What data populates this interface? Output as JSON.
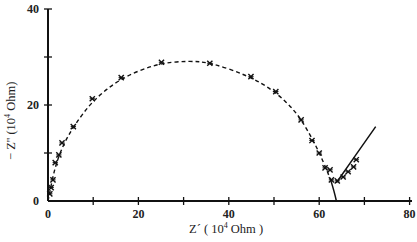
{
  "chart_data": {
    "type": "scatter",
    "title": "",
    "xlabel": "Z´ (10⁴ Ohm)",
    "ylabel": "− Z'' (10⁴ Ohm)",
    "xlim": [
      0,
      80
    ],
    "ylim": [
      0,
      40
    ],
    "x_ticks": [
      0,
      20,
      40,
      60,
      80
    ],
    "x_minor_ticks": [
      10,
      30,
      50,
      70
    ],
    "y_ticks": [
      0,
      20,
      40
    ],
    "y_minor_ticks": [
      10,
      30
    ],
    "grid": false,
    "legend": null,
    "series": [
      {
        "name": "measured",
        "marker": "x",
        "points": [
          [
            0.4,
            1.5
          ],
          [
            0.7,
            2.8
          ],
          [
            1.1,
            4.4
          ],
          [
            1.6,
            8.0
          ],
          [
            2.4,
            9.6
          ],
          [
            3.1,
            12.1
          ],
          [
            5.6,
            15.5
          ],
          [
            9.8,
            21.3
          ],
          [
            16.2,
            25.7
          ],
          [
            25.1,
            28.9
          ],
          [
            35.8,
            28.7
          ],
          [
            44.9,
            25.9
          ],
          [
            50.4,
            22.8
          ],
          [
            56.0,
            16.9
          ],
          [
            58.4,
            12.6
          ],
          [
            60.0,
            10.0
          ],
          [
            61.3,
            6.9
          ],
          [
            62.4,
            6.5
          ],
          [
            62.7,
            4.4
          ],
          [
            64.0,
            4.2
          ],
          [
            65.3,
            5.0
          ],
          [
            66.4,
            6.1
          ],
          [
            67.6,
            7.1
          ],
          [
            68.2,
            8.6
          ]
        ]
      },
      {
        "name": "fitted semicircle",
        "style": "dashed",
        "points": [
          [
            0,
            0
          ],
          [
            1.5,
            7
          ],
          [
            3.5,
            12
          ],
          [
            6,
            16
          ],
          [
            10,
            21
          ],
          [
            16,
            25.5
          ],
          [
            24,
            28.6
          ],
          [
            31,
            29.2
          ],
          [
            36,
            28.8
          ],
          [
            44,
            26.2
          ],
          [
            50,
            23
          ],
          [
            55,
            18.5
          ],
          [
            58.5,
            13
          ],
          [
            61,
            8
          ],
          [
            62.5,
            4.5
          ]
        ]
      },
      {
        "name": "fitted arc to axis",
        "style": "solid",
        "points": [
          [
            62.5,
            4.5
          ],
          [
            63.3,
            2
          ],
          [
            63.8,
            0
          ]
        ]
      },
      {
        "name": "diffusion line",
        "style": "solid",
        "points": [
          [
            63.8,
            3.8
          ],
          [
            72.5,
            15.5
          ]
        ]
      }
    ]
  },
  "axes": {
    "x_tick_labels": [
      "0",
      "20",
      "40",
      "60",
      "80"
    ],
    "y_tick_labels": [
      "0",
      "20",
      "40"
    ],
    "xlabel_prefix": "Z´ ( 10",
    "xlabel_sup": "4",
    "xlabel_suffix": " Ohm )",
    "ylabel_prefix": "− Z'' (10",
    "ylabel_sup": "4",
    "ylabel_suffix": " Ohm)"
  }
}
